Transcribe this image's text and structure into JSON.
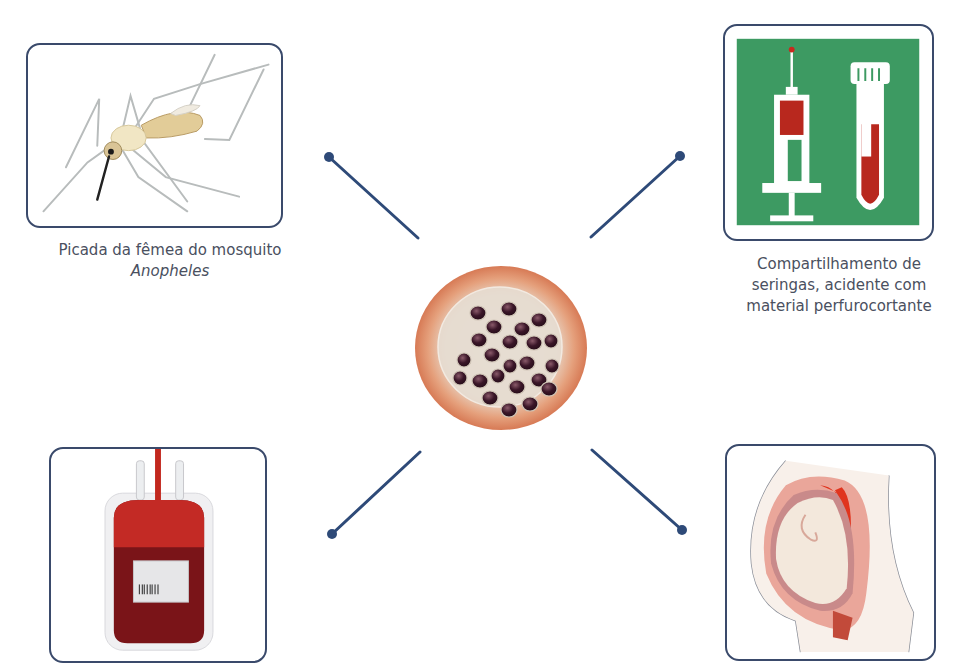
{
  "diagram": {
    "center": {
      "label": "Plasmodium-infected red blood cell (schizont)",
      "icon": "infected-cell-icon"
    },
    "nodes": [
      {
        "id": "mosquito",
        "caption_line1": "Picada da fêmea do mosquito",
        "caption_line2": "Anopheles",
        "icon": "mosquito-icon",
        "position": "top-left"
      },
      {
        "id": "syringe",
        "caption_line1": "Compartilhamento de",
        "caption_line2": "seringas, acidente com",
        "caption_line3": "material perfurocortante",
        "icon": "syringe-and-test-tube-icon",
        "position": "top-right"
      },
      {
        "id": "transfusion",
        "caption_line1": "",
        "icon": "blood-bag-icon",
        "position": "bottom-left"
      },
      {
        "id": "congenital",
        "caption_line1": "",
        "icon": "pregnancy-icon",
        "position": "bottom-right"
      }
    ],
    "colors": {
      "frame": "#3a4a6b",
      "connector": "#2e4a78",
      "caption_text": "#4a5060",
      "syringe_bg": "#3d9a62",
      "blood": "#b8281e"
    }
  }
}
